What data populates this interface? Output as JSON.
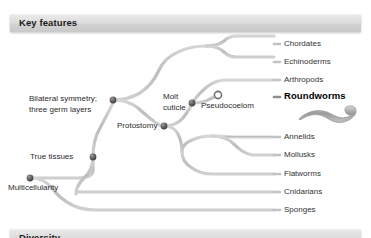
{
  "figure": {
    "type": "phylogenetic-tree",
    "orientation": "left-to-right"
  },
  "sections": {
    "key_features": {
      "title": "Key features"
    },
    "diversity": {
      "title": "Diversity"
    }
  },
  "colors": {
    "branch": "#b9b9b9",
    "branch_highlight": "#8d8d8d",
    "node": "#5a5a5a",
    "node_open": "#ffffff",
    "text": "#2b2b2b",
    "bar_light": "#e9e9e9",
    "bar_dark": "#c9c9c9"
  },
  "feature_nodes": [
    {
      "id": "multicellularity",
      "label": "Multicellularity",
      "x": 30,
      "y": 178,
      "label_x": 8,
      "label_y": 182,
      "lines": [
        "Multicellularity"
      ]
    },
    {
      "id": "true-tissues",
      "label": "True tissues",
      "x": 93,
      "y": 157,
      "label_x": 30,
      "label_y": 152,
      "lines": [
        "True tissues"
      ]
    },
    {
      "id": "bilateral-symmetry",
      "label": "Bilateral symmetry; three germ layers",
      "x": 113,
      "y": 100,
      "label_x": 29,
      "label_y": 94,
      "lines": [
        "Bilateral symmetry;",
        "three germ layers"
      ]
    },
    {
      "id": "protostomy",
      "label": "Protostomy",
      "x": 164,
      "y": 126,
      "label_x": 117,
      "label_y": 121,
      "lines": [
        "Protostomy"
      ]
    },
    {
      "id": "molt-cuticle",
      "label": "Molt cuticle",
      "x": 192,
      "y": 103,
      "label_x": 163,
      "label_y": 92,
      "lines": [
        "Molt",
        "cuticle"
      ]
    },
    {
      "id": "pseudocoelom",
      "label": "Pseudocoelom",
      "x": 218,
      "y": 95,
      "label_x": 201,
      "label_y": 100,
      "lines": [
        "Pseudocoelom"
      ]
    }
  ],
  "taxa": [
    {
      "id": "chordates",
      "label": "Chordates",
      "y": 44,
      "label_x": 284,
      "highlight": false
    },
    {
      "id": "echinoderms",
      "label": "Echinoderms",
      "y": 62,
      "label_x": 284,
      "highlight": false
    },
    {
      "id": "arthropods",
      "label": "Arthropods",
      "y": 80,
      "label_x": 284,
      "highlight": false
    },
    {
      "id": "roundworms",
      "label": "Roundworms",
      "y": 97,
      "label_x": 284,
      "highlight": true
    },
    {
      "id": "annelids",
      "label": "Annelids",
      "y": 137,
      "label_x": 284,
      "highlight": false
    },
    {
      "id": "mollusks",
      "label": "Mollusks",
      "y": 155,
      "label_x": 284,
      "highlight": false
    },
    {
      "id": "flatworms",
      "label": "Flatworms",
      "y": 174,
      "label_x": 284,
      "highlight": false
    },
    {
      "id": "cnidarians",
      "label": "Cnidarians",
      "y": 192,
      "label_x": 284,
      "highlight": false
    },
    {
      "id": "sponges",
      "label": "Sponges",
      "y": 210,
      "label_x": 284,
      "highlight": false
    }
  ],
  "illustration": {
    "name": "roundworm-illustration",
    "caption": "nematode worm silhouette"
  },
  "labels": {
    "chordates": "Chordates",
    "echinoderms": "Echinoderms",
    "arthropods": "Arthropods",
    "roundworms": "Roundworms",
    "annelids": "Annelids",
    "mollusks": "Mollusks",
    "flatworms": "Flatworms",
    "cnidarians": "Cnidarians",
    "sponges": "Sponges",
    "multicellularity": "Multicellularity",
    "true_tissues": "True tissues",
    "bilateral_1": "Bilateral symmetry;",
    "bilateral_2": "three germ layers",
    "protostomy": "Protostomy",
    "molt_1": "Molt",
    "molt_2": "cuticle",
    "pseudocoelom": "Pseudocoelom"
  }
}
